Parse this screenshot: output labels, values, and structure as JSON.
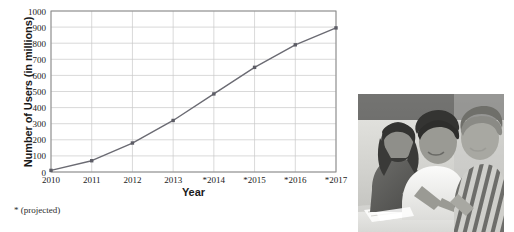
{
  "figure": {
    "footnote": "* (projected)"
  },
  "photo": {
    "name": "students-studying-photo",
    "description": "Three students studying together at a desk"
  },
  "colors": {
    "line": "#6b6b73",
    "marker": "#5d5d66",
    "grid": "#c8c8c8",
    "axis": "#8a8a8a",
    "text": "#1a1a1a",
    "background": "#ffffff"
  },
  "chart_data": {
    "type": "line",
    "title": "",
    "xlabel": "Year",
    "ylabel": "Number of Users (in millions)",
    "x": [
      2010,
      2011,
      2012,
      2013,
      2014,
      2015,
      2016,
      2017
    ],
    "categories": [
      "2010",
      "2011",
      "2012",
      "2013",
      "*2014",
      "*2015",
      "*2016",
      "*2017"
    ],
    "values": [
      10,
      70,
      180,
      320,
      485,
      650,
      790,
      895
    ],
    "series": [
      {
        "name": "Number of Users",
        "values": [
          10,
          70,
          180,
          320,
          485,
          650,
          790,
          895
        ]
      }
    ],
    "ylim": [
      0,
      1000
    ],
    "yticks": [
      0,
      100,
      200,
      300,
      400,
      500,
      600,
      700,
      800,
      900,
      1000
    ],
    "ytick_labels": [
      "0",
      "100",
      "200",
      "300",
      "400",
      "500",
      "600",
      "700",
      "800",
      "900",
      "1000"
    ],
    "xtick_labels": [
      "2010",
      "2011",
      "2012",
      "2013",
      "*2014",
      "*2015",
      "*2016",
      "*2017"
    ],
    "grid": true,
    "legend": false,
    "marker": "square",
    "annotations": [
      "* (projected)"
    ]
  }
}
